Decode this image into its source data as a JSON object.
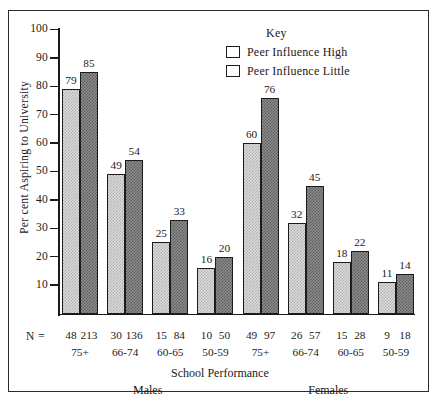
{
  "chart_data": {
    "type": "bar",
    "title": "",
    "xlabel": "School Performance",
    "ylabel": "Per cent Aspiring to University",
    "ylim": [
      0,
      100
    ],
    "yticks": [
      10,
      20,
      30,
      40,
      50,
      60,
      70,
      80,
      90,
      100
    ],
    "grid": false,
    "legend_position": "top-right",
    "legend_title": "Key",
    "n_row_label": "N =",
    "group_labels": [
      "Males",
      "Females"
    ],
    "categories": [
      "75+",
      "66-74",
      "60-65",
      "50-59",
      "75+",
      "66-74",
      "60-65",
      "50-59"
    ],
    "series": [
      {
        "name": "Peer Influence High",
        "values": [
          79,
          49,
          25,
          16,
          60,
          32,
          18,
          11
        ],
        "color": "#dcdcdc"
      },
      {
        "name": "Peer Influence Little",
        "values": [
          85,
          54,
          33,
          20,
          76,
          45,
          22,
          14
        ],
        "color": "#8c8c8c"
      }
    ],
    "n_values": [
      {
        "high": "48",
        "little": "213"
      },
      {
        "high": "30",
        "little": "136"
      },
      {
        "high": "15",
        "little": "84"
      },
      {
        "high": "10",
        "little": "50"
      },
      {
        "high": "49",
        "little": "97"
      },
      {
        "high": "26",
        "little": "57"
      },
      {
        "high": "15",
        "little": "28"
      },
      {
        "high": "9",
        "little": "18"
      }
    ]
  }
}
